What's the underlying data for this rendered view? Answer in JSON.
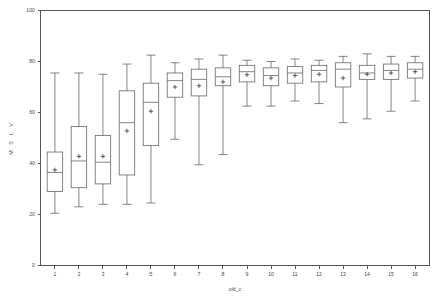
{
  "chart_data": {
    "type": "box",
    "title": "",
    "xlabel": "old_c",
    "ylabel": "M S L V",
    "xlim": [
      0.4,
      16.6
    ],
    "ylim": [
      0,
      100
    ],
    "grid": false,
    "legend": null,
    "y_ticks": [
      0,
      20,
      40,
      60,
      80,
      100
    ],
    "x_ticks": [
      1,
      2,
      3,
      4,
      5,
      6,
      7,
      8,
      9,
      10,
      11,
      12,
      13,
      14,
      15,
      16
    ],
    "categories": [
      "1",
      "2",
      "3",
      "4",
      "5",
      "6",
      "7",
      "8",
      "9",
      "10",
      "11",
      "12",
      "13",
      "14",
      "15",
      "16"
    ],
    "boxes": [
      {
        "category": "1",
        "whisker_low": 20.5,
        "q1": 29.0,
        "median": 36.5,
        "q3": 44.5,
        "whisker_high": 75.5,
        "mean": 37.5
      },
      {
        "category": "2",
        "whisker_low": 23.0,
        "q1": 30.5,
        "median": 41.0,
        "q3": 54.5,
        "whisker_high": 75.5,
        "mean": 42.8
      },
      {
        "category": "3",
        "whisker_low": 24.0,
        "q1": 32.0,
        "median": 40.5,
        "q3": 51.0,
        "whisker_high": 75.0,
        "mean": 42.8
      },
      {
        "category": "4",
        "whisker_low": 24.0,
        "q1": 35.5,
        "median": 56.0,
        "q3": 68.5,
        "whisker_high": 79.0,
        "mean": 52.8
      },
      {
        "category": "5",
        "whisker_low": 24.5,
        "q1": 47.0,
        "median": 64.0,
        "q3": 71.5,
        "whisker_high": 82.5,
        "mean": 60.5
      },
      {
        "category": "6",
        "whisker_low": 49.5,
        "q1": 66.0,
        "median": 72.5,
        "q3": 75.5,
        "whisker_high": 79.5,
        "mean": 70.0
      },
      {
        "category": "7",
        "whisker_low": 39.5,
        "q1": 66.5,
        "median": 73.0,
        "q3": 77.0,
        "whisker_high": 81.0,
        "mean": 70.5
      },
      {
        "category": "8",
        "whisker_low": 43.5,
        "q1": 70.5,
        "median": 74.0,
        "q3": 77.5,
        "whisker_high": 82.5,
        "mean": 72.0
      },
      {
        "category": "9",
        "whisker_low": 62.5,
        "q1": 72.0,
        "median": 76.0,
        "q3": 78.5,
        "whisker_high": 80.5,
        "mean": 74.8
      },
      {
        "category": "10",
        "whisker_low": 62.5,
        "q1": 70.5,
        "median": 74.5,
        "q3": 77.5,
        "whisker_high": 80.0,
        "mean": 73.5
      },
      {
        "category": "11",
        "whisker_low": 64.5,
        "q1": 71.5,
        "median": 75.5,
        "q3": 78.0,
        "whisker_high": 81.0,
        "mean": 74.5
      },
      {
        "category": "12",
        "whisker_low": 63.5,
        "q1": 72.0,
        "median": 76.5,
        "q3": 78.5,
        "whisker_high": 80.5,
        "mean": 75.0
      },
      {
        "category": "13",
        "whisker_low": 56.0,
        "q1": 70.0,
        "median": 77.0,
        "q3": 79.5,
        "whisker_high": 82.0,
        "mean": 73.5
      },
      {
        "category": "14",
        "whisker_low": 57.5,
        "q1": 73.0,
        "median": 75.5,
        "q3": 78.5,
        "whisker_high": 83.0,
        "mean": 75.0
      },
      {
        "category": "15",
        "whisker_low": 60.5,
        "q1": 73.0,
        "median": 76.5,
        "q3": 79.0,
        "whisker_high": 82.0,
        "mean": 75.5
      },
      {
        "category": "16",
        "whisker_low": 64.5,
        "q1": 73.5,
        "median": 77.0,
        "q3": 79.5,
        "whisker_high": 82.0,
        "mean": 76.0
      }
    ]
  },
  "colors": {
    "axis": "#555555",
    "box_stroke": "#666666",
    "mean_marker": "#333333",
    "tick_text": "#4a4a4a",
    "background": "#ffffff"
  }
}
